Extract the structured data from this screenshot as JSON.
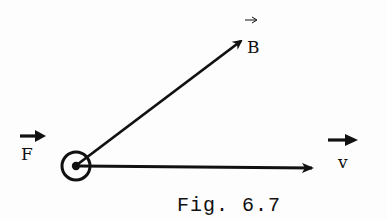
{
  "figure": {
    "caption": "Fig. 6.7",
    "colors": {
      "ink": "#111111",
      "background": "#fdfdfd"
    },
    "origin_symbol": "out-of-page-dot-in-circle",
    "vectors": [
      {
        "name": "B",
        "label": "B",
        "overarrow": "thin",
        "from": [
          76,
          166
        ],
        "to": [
          245,
          38
        ]
      },
      {
        "name": "v",
        "label": "v",
        "overarrow": "bold",
        "from": [
          76,
          166
        ],
        "to": [
          315,
          168
        ]
      },
      {
        "name": "F",
        "label": "F",
        "overarrow": "bold",
        "direction": "out-of-page"
      }
    ]
  }
}
